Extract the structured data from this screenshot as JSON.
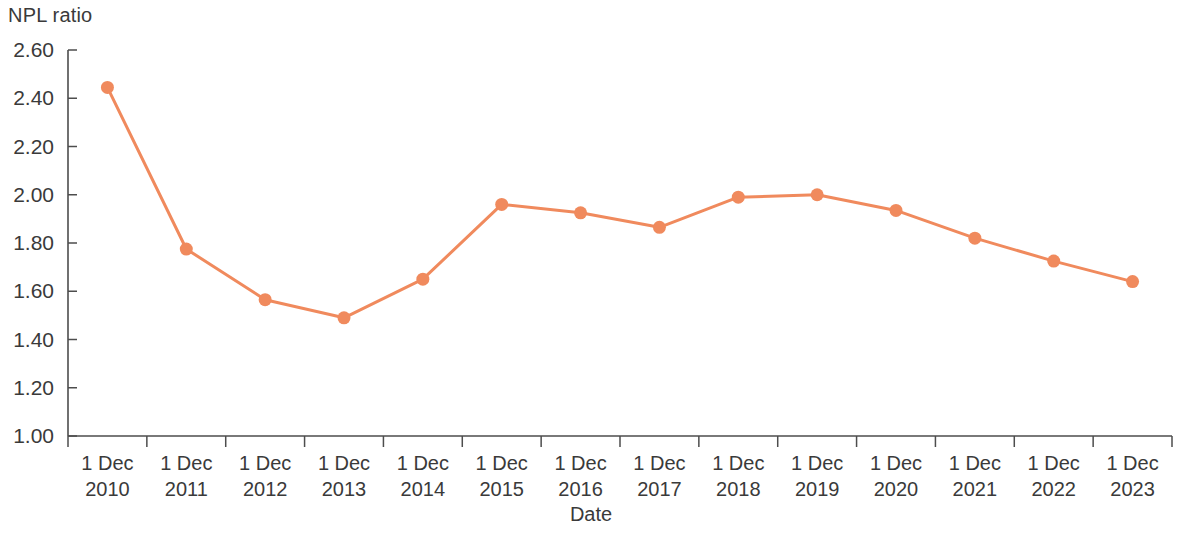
{
  "chart_data": {
    "type": "line",
    "title": "",
    "ylabel": "NPL ratio",
    "xlabel": "Date",
    "categories": [
      "1 Dec 2010",
      "1 Dec 2011",
      "1 Dec 2012",
      "1 Dec 2013",
      "1 Dec 2014",
      "1 Dec 2015",
      "1 Dec 2016",
      "1 Dec 2017",
      "1 Dec 2018",
      "1 Dec 2019",
      "1 Dec 2020",
      "1 Dec 2021",
      "1 Dec 2022",
      "1 Dec 2023"
    ],
    "category_lines": [
      [
        "1 Dec",
        "2010"
      ],
      [
        "1 Dec",
        "2011"
      ],
      [
        "1 Dec",
        "2012"
      ],
      [
        "1 Dec",
        "2013"
      ],
      [
        "1 Dec",
        "2014"
      ],
      [
        "1 Dec",
        "2015"
      ],
      [
        "1 Dec",
        "2016"
      ],
      [
        "1 Dec",
        "2017"
      ],
      [
        "1 Dec",
        "2018"
      ],
      [
        "1 Dec",
        "2019"
      ],
      [
        "1 Dec",
        "2020"
      ],
      [
        "1 Dec",
        "2021"
      ],
      [
        "1 Dec",
        "2022"
      ],
      [
        "1 Dec",
        "2023"
      ]
    ],
    "values": [
      2.445,
      1.775,
      1.565,
      1.49,
      1.65,
      1.96,
      1.925,
      1.865,
      1.99,
      2.0,
      1.935,
      1.82,
      1.725,
      1.64
    ],
    "ylim": [
      1.0,
      2.6
    ],
    "ytick_values": [
      1.0,
      1.2,
      1.4,
      1.6,
      1.8,
      2.0,
      2.2,
      2.4,
      2.6
    ],
    "ytick_labels": [
      "1.00",
      "1.20",
      "1.40",
      "1.60",
      "1.80",
      "2.00",
      "2.20",
      "2.40",
      "2.60"
    ],
    "grid": false,
    "legend": null,
    "series_color": "#F08A5D",
    "axis_color": "#4d4d4d",
    "text_color": "#3a3a3a",
    "marker": "circle",
    "marker_size": 13,
    "line_width": 3
  }
}
